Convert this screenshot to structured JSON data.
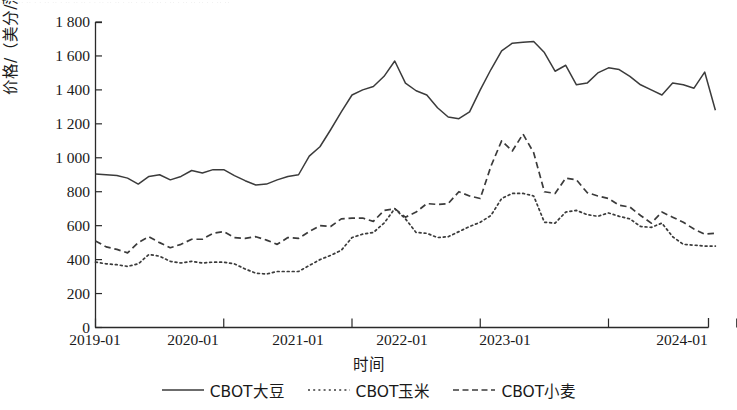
{
  "artifact_text": "· ·· · ·· ·· · · ·· ·· · ·· ·· ·· · · ·· ·· ·· · ·· · ·· ·· ·· · ·· · ·· ·· ·· · · ·· ··",
  "axes": {
    "ylabel": "价格/（美分/蒲式耳）",
    "xlabel": "时间",
    "yticks": [
      "0",
      "200",
      "400",
      "600",
      "800",
      "1 000",
      "1 200",
      "1 400",
      "1 600",
      "1 800"
    ],
    "xticks": [
      "2019-01",
      "2020-01",
      "2021-01",
      "2022-01",
      "2023-01",
      "2024-01"
    ]
  },
  "legend": {
    "items": [
      {
        "label": "CBOT大豆",
        "style": "solid"
      },
      {
        "label": "CBOT玉米",
        "style": "dotted"
      },
      {
        "label": "CBOT小麦",
        "style": "dashed"
      }
    ]
  },
  "chart_data": {
    "type": "line",
    "title": "",
    "xlabel": "时间",
    "ylabel": "价格/（美分/蒲式耳）",
    "xlim": [
      "2019-01",
      "2024-01"
    ],
    "ylim": [
      0,
      1800
    ],
    "ytick_step": 200,
    "grid": false,
    "legend_position": "bottom",
    "x": [
      "2019-01",
      "2019-02",
      "2019-03",
      "2019-04",
      "2019-05",
      "2019-06",
      "2019-07",
      "2019-08",
      "2019-09",
      "2019-10",
      "2019-11",
      "2019-12",
      "2020-01",
      "2020-02",
      "2020-03",
      "2020-04",
      "2020-05",
      "2020-06",
      "2020-07",
      "2020-08",
      "2020-09",
      "2020-10",
      "2020-11",
      "2020-12",
      "2021-01",
      "2021-02",
      "2021-03",
      "2021-04",
      "2021-05",
      "2021-06",
      "2021-07",
      "2021-08",
      "2021-09",
      "2021-10",
      "2021-11",
      "2021-12",
      "2022-01",
      "2022-02",
      "2022-03",
      "2022-04",
      "2022-05",
      "2022-06",
      "2022-07",
      "2022-08",
      "2022-09",
      "2022-10",
      "2022-11",
      "2022-12",
      "2023-01",
      "2023-02",
      "2023-03",
      "2023-04",
      "2023-05",
      "2023-06",
      "2023-07",
      "2023-08",
      "2023-09",
      "2023-10",
      "2023-11"
    ],
    "series": [
      {
        "name": "CBOT大豆",
        "style": "solid",
        "color": "#3b3b3b",
        "values": [
          905,
          900,
          895,
          880,
          845,
          890,
          900,
          870,
          890,
          925,
          910,
          930,
          930,
          895,
          865,
          840,
          845,
          870,
          890,
          900,
          1010,
          1065,
          1165,
          1270,
          1370,
          1400,
          1420,
          1480,
          1570,
          1440,
          1395,
          1370,
          1295,
          1240,
          1230,
          1270,
          1400,
          1520,
          1630,
          1675,
          1680,
          1685,
          1620,
          1510,
          1545,
          1430,
          1440,
          1500,
          1530,
          1520,
          1480,
          1430,
          1400,
          1370,
          1440,
          1430,
          1410,
          1505,
          1280
        ]
      },
      {
        "name": "CBOT玉米",
        "style": "dotted",
        "color": "#3b3b3b",
        "values": [
          385,
          375,
          370,
          360,
          375,
          430,
          420,
          390,
          380,
          390,
          380,
          385,
          385,
          375,
          345,
          320,
          315,
          330,
          330,
          330,
          365,
          400,
          425,
          455,
          530,
          550,
          560,
          615,
          700,
          640,
          560,
          555,
          530,
          535,
          565,
          595,
          620,
          660,
          760,
          790,
          790,
          775,
          620,
          615,
          680,
          690,
          665,
          655,
          675,
          655,
          640,
          595,
          590,
          615,
          535,
          490,
          485,
          480,
          480
        ]
      },
      {
        "name": "CBOT小麦",
        "style": "dashed",
        "color": "#3b3b3b",
        "values": [
          510,
          475,
          460,
          440,
          500,
          535,
          500,
          470,
          490,
          520,
          520,
          555,
          565,
          530,
          525,
          535,
          515,
          490,
          530,
          525,
          565,
          600,
          595,
          640,
          645,
          645,
          625,
          690,
          700,
          650,
          680,
          730,
          725,
          730,
          800,
          775,
          760,
          950,
          1100,
          1040,
          1140,
          1030,
          800,
          790,
          880,
          870,
          795,
          775,
          760,
          720,
          710,
          660,
          615,
          680,
          650,
          620,
          580,
          550,
          555
        ]
      }
    ]
  }
}
